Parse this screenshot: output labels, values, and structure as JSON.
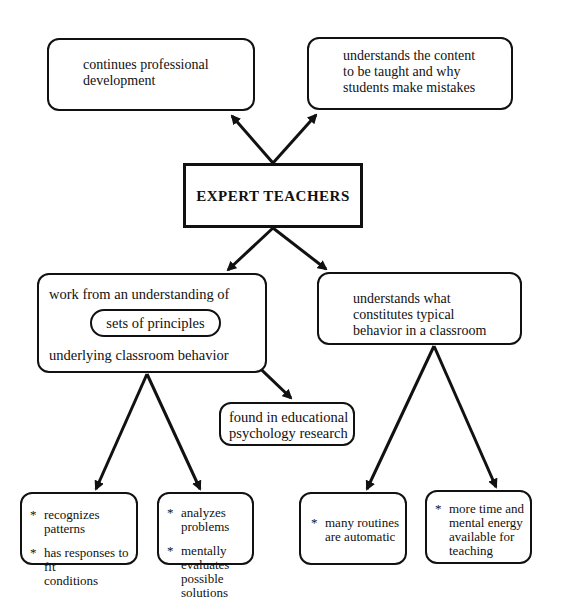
{
  "diagram": {
    "central": {
      "label": "EXPERT TEACHERS"
    },
    "top_left": {
      "text": "continues professional\ndevelopment"
    },
    "top_right": {
      "text": "understands the content\nto be taught and why\nstudents make mistakes"
    },
    "mid_left": {
      "line1": "work from an understanding of",
      "inner": "sets of principles",
      "line2": "underlying classroom behavior"
    },
    "mid_right": {
      "text": "understands what\nconstitutes typical\nbehavior in a classroom"
    },
    "research": {
      "text": "found in educational\npsychology research"
    },
    "bottom": [
      {
        "bullets": [
          "recognizes patterns",
          "has responses to fit\nconditions"
        ]
      },
      {
        "bullets": [
          "analyzes problems",
          "mentally evaluates\npossible solutions"
        ]
      },
      {
        "bullets": [
          "many routines\nare automatic"
        ]
      },
      {
        "bullets": [
          "more time and\nmental energy\navailable for\nteaching"
        ]
      }
    ],
    "bullet_symbol": "*",
    "colors": {
      "line": "#111111",
      "background": "#ffffff"
    }
  }
}
